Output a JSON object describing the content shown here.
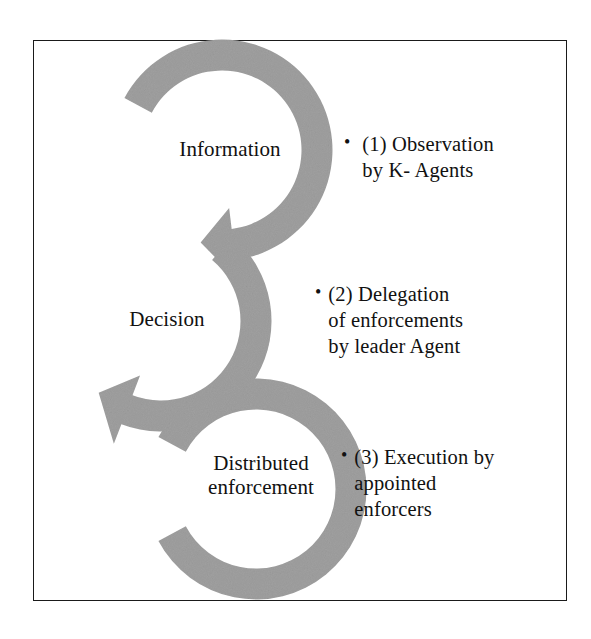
{
  "figure": {
    "kind": "circular-process-diagram",
    "frame_border_color": "#1a1a1a",
    "background_color": "#ffffff",
    "arrow_fill_color": "#a0a0a0",
    "text_color": "#111111"
  },
  "rings": [
    {
      "id": "information",
      "label": "Information",
      "order": 1,
      "center": {
        "x": 222,
        "y": 150
      },
      "radius": 95,
      "thickness": 31,
      "gap_position": "upper-left",
      "arrowhead": "bottom, pointing down-left"
    },
    {
      "id": "decision",
      "label": "Decision",
      "order": 2,
      "center": {
        "x": 161,
        "y": 321
      },
      "radius": 95,
      "thickness": 31,
      "gap_position": "right",
      "arrowhead": "bottom-left, pointing down-right"
    },
    {
      "id": "distributed-enforcement",
      "label": "Distributed\nenforcement",
      "order": 3,
      "center": {
        "x": 256,
        "y": 489
      },
      "radius": 95,
      "thickness": 31,
      "gap_position": "upper-left",
      "arrowhead": "none visible"
    }
  ],
  "bullets": [
    {
      "id": "observation",
      "marker": "•",
      "number": "(1)",
      "text": "(1) Observation\nby K- Agents"
    },
    {
      "id": "delegation",
      "marker": "•",
      "number": "(2)",
      "text": "(2) Delegation\nof enforcements\nby leader Agent"
    },
    {
      "id": "execution",
      "marker": "•",
      "number": "(3)",
      "text": "(3) Execution by\nappointed\nenforcers"
    }
  ]
}
